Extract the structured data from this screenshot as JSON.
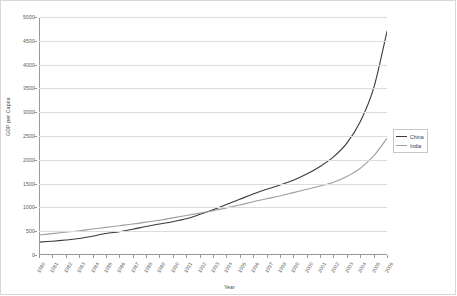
{
  "chart_data": {
    "type": "line",
    "title": "",
    "xlabel": "Year",
    "ylabel": "GDP per Capita",
    "xlim": [
      1980,
      2006
    ],
    "ylim": [
      0,
      5000
    ],
    "yticks": [
      0,
      500,
      1000,
      1500,
      2000,
      2500,
      3000,
      3500,
      4000,
      4500,
      5000
    ],
    "grid": "horizontal",
    "legend_position": "right",
    "categories": [
      "1980",
      "1981",
      "1982",
      "1983",
      "1984",
      "1985",
      "1986",
      "1987",
      "1988",
      "1989",
      "1990",
      "1991",
      "1992",
      "1993",
      "1994",
      "1995",
      "1996",
      "1997",
      "1998",
      "1999",
      "2000",
      "2001",
      "2002",
      "2003",
      "2004",
      "2005",
      "2006"
    ],
    "series": [
      {
        "name": "China",
        "color": "#3a3a3a",
        "values": [
          270,
          290,
          315,
          345,
          395,
          450,
          490,
          540,
          600,
          650,
          700,
          760,
          850,
          950,
          1060,
          1170,
          1280,
          1380,
          1470,
          1570,
          1700,
          1860,
          2060,
          2350,
          2800,
          3500,
          4700
        ]
      },
      {
        "name": "India",
        "color": "#9e9e9e",
        "values": [
          420,
          450,
          480,
          510,
          545,
          580,
          615,
          650,
          690,
          730,
          780,
          830,
          880,
          930,
          990,
          1050,
          1120,
          1180,
          1240,
          1310,
          1380,
          1450,
          1530,
          1650,
          1820,
          2080,
          2450
        ]
      }
    ]
  },
  "legend": {
    "items": [
      {
        "label": "China"
      },
      {
        "label": "India"
      }
    ]
  }
}
